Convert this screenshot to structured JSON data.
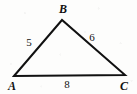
{
  "figure": {
    "type": "triangle-diagram",
    "stroke_color": "#111111",
    "background_color": "#fdfdfc",
    "stroke_width": 2,
    "vertices": [
      {
        "label": "A",
        "x": 14,
        "y": 76,
        "label_x": 12,
        "label_y": 86
      },
      {
        "label": "B",
        "x": 62,
        "y": 20,
        "label_x": 63,
        "label_y": 9
      },
      {
        "label": "C",
        "x": 125,
        "y": 75,
        "label_x": 124,
        "label_y": 86
      }
    ],
    "sides": [
      {
        "name": "AB",
        "length": "5",
        "label_x": 29,
        "label_y": 42
      },
      {
        "name": "BC",
        "length": "6",
        "label_x": 92,
        "label_y": 37
      },
      {
        "name": "AC",
        "length": "8",
        "label_x": 67,
        "label_y": 84
      }
    ]
  }
}
